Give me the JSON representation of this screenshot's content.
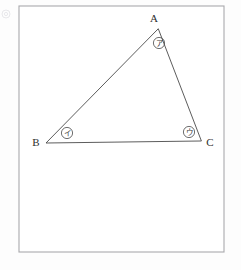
{
  "figure": {
    "background_color": "#fdfdfd",
    "frame": {
      "name": "figure-border",
      "x": 19,
      "y": 6,
      "width": 205,
      "height": 246,
      "stroke_color": "#a9a9ad",
      "fill_color": "#ffffff"
    },
    "line_color": "#4a4a4a",
    "label_color": "#2e2e2e",
    "triangle": {
      "name": "triangle-abc",
      "vertices": [
        {
          "id": "A",
          "label": "A",
          "x": 158,
          "y": 29
        },
        {
          "id": "B",
          "label": "B",
          "x": 46,
          "y": 143
        },
        {
          "id": "C",
          "label": "C",
          "x": 201,
          "y": 141
        }
      ],
      "sides": [
        {
          "name": "side-ab",
          "from": "A",
          "to": "B"
        },
        {
          "name": "side-bc",
          "from": "B",
          "to": "C"
        },
        {
          "name": "side-ca",
          "from": "C",
          "to": "A"
        }
      ]
    },
    "vertex_labels": [
      {
        "name": "vertex-label-a",
        "text": "A",
        "x": 154,
        "y": 19,
        "anchor": "middle"
      },
      {
        "name": "vertex-label-b",
        "text": "B",
        "x": 36,
        "y": 143,
        "anchor": "middle"
      },
      {
        "name": "vertex-label-c",
        "text": "C",
        "x": 210,
        "y": 143,
        "anchor": "middle"
      }
    ],
    "angle_markers": [
      {
        "name": "angle-marker-a",
        "at_vertex": "A",
        "glyph": "ア",
        "circled_glyph": "㋐",
        "cx": 159,
        "cy": 43,
        "r": 5.6
      },
      {
        "name": "angle-marker-b",
        "at_vertex": "B",
        "glyph": "イ",
        "circled_glyph": "㋑",
        "cx": 67,
        "cy": 133,
        "r": 5.6
      },
      {
        "name": "angle-marker-c",
        "at_vertex": "C",
        "glyph": "ウ",
        "circled_glyph": "㋒",
        "cx": 189,
        "cy": 132,
        "r": 5.6
      }
    ],
    "corner_mark": {
      "name": "page-corner-speck",
      "cx": 6,
      "cy": 14,
      "r": 4
    }
  }
}
